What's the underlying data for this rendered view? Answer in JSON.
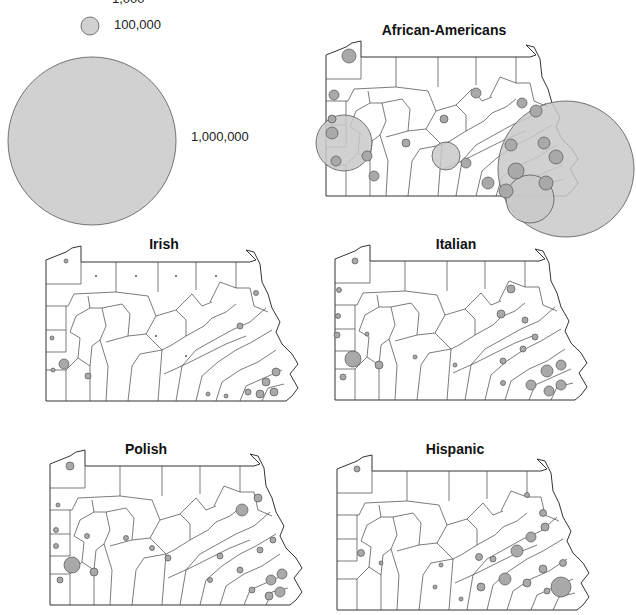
{
  "legend": {
    "title": "Proportional symbols (population)",
    "entries": [
      {
        "label": "1,000",
        "radius": 0.5
      },
      {
        "label": "100,000",
        "radius": 9
      },
      {
        "label": "1,000,000",
        "radius": 84
      }
    ],
    "fill_color": "#c9c9c9",
    "stroke_color": "#555555"
  },
  "maps": [
    {
      "id": "african-americans",
      "title": "African-Americans"
    },
    {
      "id": "irish",
      "title": "Irish"
    },
    {
      "id": "italian",
      "title": "Italian"
    },
    {
      "id": "polish",
      "title": "Polish"
    },
    {
      "id": "hispanic",
      "title": "Hispanic"
    }
  ],
  "colors": {
    "symbol_fill": "#a9a9a9",
    "large_symbol_fill": "#c9c9c9",
    "county_line": "#444444",
    "background": "#ffffff"
  }
}
